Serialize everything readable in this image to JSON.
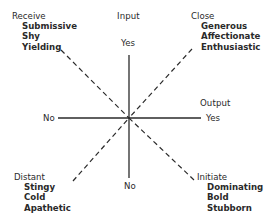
{
  "axes": {
    "vertical": {
      "label": "Input",
      "top_label": "Yes",
      "bottom_label": "No"
    },
    "horizontal": {
      "label": "Output",
      "right_label": "Yes",
      "left_label": "No"
    }
  },
  "quadrants": {
    "top_left": {
      "title": "Receive",
      "traits": [
        "Submissive",
        "Shy",
        "Yielding"
      ]
    },
    "top_right": {
      "title": "Close",
      "traits": [
        "Generous",
        "Affectionate",
        "Enthusiastic"
      ]
    },
    "bottom_left": {
      "title": "Distant",
      "traits": [
        "Stingy",
        "Cold",
        "Apathetic"
      ]
    },
    "bottom_right": {
      "title": "Initiate",
      "traits": [
        "Dominating",
        "Bold",
        "Stubborn"
      ]
    }
  },
  "colors": {
    "line": "#2a2a2a",
    "text": "#2a2a2a",
    "background": "#ffffff"
  }
}
